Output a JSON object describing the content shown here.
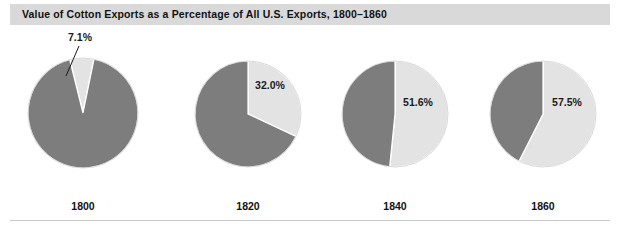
{
  "title": "Value of Cotton Exports as a Percentage of All U.S. Exports, 1800–1860",
  "colors": {
    "cotton_slice": "#e3e3e3",
    "other_slice": "#7d7d7d",
    "slice_outline": "#ffffff",
    "title_band": "#d9d9d9",
    "text": "#111111",
    "rule": "#c8c8c8",
    "background": "#ffffff"
  },
  "chart_data": {
    "type": "pie",
    "title": "Value of Cotton Exports as a Percentage of All U.S. Exports, 1800–1860",
    "xlabel": "",
    "ylabel": "",
    "legend": "none",
    "grid": false,
    "series_names": [
      "Cotton exports",
      "All other exports"
    ],
    "panels": [
      {
        "year": "1800",
        "label": "7.1%",
        "values": [
          7.1,
          92.9
        ],
        "cx": 83,
        "cy": 85,
        "r": 55,
        "start_angle": -14,
        "label_x": 80,
        "label_y": 13,
        "label_anchor": "middle",
        "leader": {
          "x1": 79,
          "y1": 18,
          "x2": 66,
          "y2": 48
        }
      },
      {
        "year": "1820",
        "label": "32.0%",
        "values": [
          32.0,
          68.0
        ],
        "cx": 248,
        "cy": 86,
        "r": 53,
        "start_angle": 0,
        "label_x": 270,
        "label_y": 61,
        "label_anchor": "middle",
        "leader": null
      },
      {
        "year": "1840",
        "label": "51.6%",
        "values": [
          51.6,
          48.4
        ],
        "cx": 395,
        "cy": 86,
        "r": 53,
        "start_angle": 0,
        "label_x": 418,
        "label_y": 78,
        "label_anchor": "middle",
        "leader": null
      },
      {
        "year": "1860",
        "label": "57.5%",
        "values": [
          57.5,
          42.5
        ],
        "cx": 543,
        "cy": 86,
        "r": 53,
        "start_angle": 0,
        "label_x": 567,
        "label_y": 78,
        "label_anchor": "middle",
        "leader": null
      }
    ],
    "years": [
      "1800",
      "1820",
      "1840",
      "1860"
    ],
    "cotton_percentages": [
      7.1,
      32.0,
      51.6,
      57.5
    ],
    "year_label_y": 182
  }
}
